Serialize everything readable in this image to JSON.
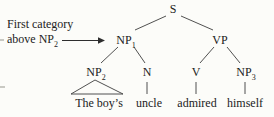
{
  "annotation": {
    "line1": "First category",
    "line2_text": "above NP",
    "line2_sub": "2"
  },
  "tree": {
    "root": {
      "base": "S"
    },
    "np1": {
      "base": "NP",
      "sub": "1"
    },
    "vp": {
      "base": "VP"
    },
    "np2": {
      "base": "NP",
      "sub": "2"
    },
    "n": {
      "base": "N"
    },
    "v": {
      "base": "V"
    },
    "np3": {
      "base": "NP",
      "sub": "3"
    },
    "leaves": {
      "np2": "The boy’s",
      "n": "uncle",
      "v": "admired",
      "np3": "himself"
    }
  },
  "colors": {
    "text": "#222222",
    "line": "#3d3d3d",
    "background": "#fcfcf9"
  }
}
